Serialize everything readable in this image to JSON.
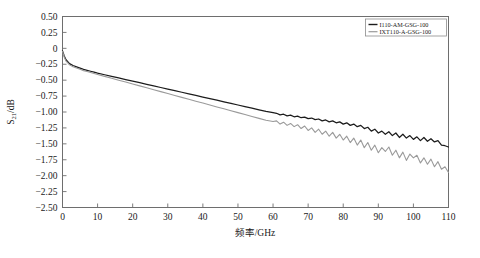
{
  "chart_data": {
    "type": "line",
    "title": "",
    "xlabel": "频率/GHz",
    "ylabel": "S21/dB",
    "ylabel_base": "S",
    "ylabel_sub": "21",
    "ylabel_unit": "/dB",
    "xlim": [
      0,
      110
    ],
    "ylim": [
      -2.5,
      0.5
    ],
    "xticks": [
      0,
      10,
      20,
      30,
      40,
      50,
      60,
      70,
      80,
      90,
      100,
      110
    ],
    "xtick_labels": [
      "0",
      "10",
      "20",
      "30",
      "40",
      "50",
      "60",
      "70",
      "80",
      "90",
      "100",
      "110"
    ],
    "yticks": [
      0.5,
      0.25,
      0,
      -0.25,
      -0.5,
      -0.75,
      -1.0,
      -1.25,
      -1.5,
      -1.75,
      -2.0,
      -2.25,
      -2.5
    ],
    "ytick_labels": [
      "0.50",
      "0.25",
      "0",
      "-0.25",
      "-0.50",
      "-0.75",
      "-1.00",
      "-1.25",
      "-1.50",
      "-1.75",
      "-2.00",
      "-2.25",
      "-2.50"
    ],
    "grid": false,
    "legend_position": "top-right",
    "series": [
      {
        "name": "I110-AM-GSG-100",
        "color": "#1c1c1c",
        "x": [
          0,
          0.5,
          1,
          1.5,
          2,
          3,
          4,
          5,
          6,
          7,
          8,
          9,
          10,
          12,
          14,
          16,
          18,
          20,
          22,
          24,
          26,
          28,
          30,
          32,
          34,
          36,
          38,
          40,
          42,
          44,
          46,
          48,
          50,
          52,
          54,
          56,
          58,
          60,
          61,
          62,
          63,
          64,
          65,
          66,
          67,
          68,
          69,
          70,
          71,
          72,
          73,
          74,
          75,
          76,
          77,
          78,
          79,
          80,
          81,
          82,
          83,
          84,
          85,
          86,
          87,
          88,
          89,
          90,
          91,
          92,
          93,
          94,
          95,
          96,
          97,
          98,
          99,
          100,
          101,
          102,
          103,
          104,
          105,
          106,
          107,
          108,
          109,
          110
        ],
        "y": [
          -0.04,
          -0.12,
          -0.18,
          -0.21,
          -0.24,
          -0.27,
          -0.29,
          -0.31,
          -0.33,
          -0.345,
          -0.36,
          -0.375,
          -0.39,
          -0.415,
          -0.44,
          -0.465,
          -0.49,
          -0.515,
          -0.54,
          -0.565,
          -0.59,
          -0.615,
          -0.64,
          -0.665,
          -0.69,
          -0.715,
          -0.74,
          -0.765,
          -0.79,
          -0.815,
          -0.84,
          -0.865,
          -0.89,
          -0.915,
          -0.94,
          -0.965,
          -0.99,
          -1.01,
          -1.02,
          -1.045,
          -1.035,
          -1.06,
          -1.05,
          -1.075,
          -1.065,
          -1.09,
          -1.08,
          -1.105,
          -1.095,
          -1.12,
          -1.11,
          -1.14,
          -1.125,
          -1.155,
          -1.14,
          -1.17,
          -1.155,
          -1.19,
          -1.17,
          -1.21,
          -1.19,
          -1.23,
          -1.21,
          -1.26,
          -1.24,
          -1.3,
          -1.27,
          -1.33,
          -1.3,
          -1.35,
          -1.31,
          -1.37,
          -1.33,
          -1.4,
          -1.35,
          -1.41,
          -1.37,
          -1.43,
          -1.39,
          -1.45,
          -1.4,
          -1.46,
          -1.42,
          -1.47,
          -1.45,
          -1.52,
          -1.53,
          -1.55
        ]
      },
      {
        "name": "IXT110-A-GSG-100",
        "color": "#9a9a9a",
        "x": [
          0,
          0.5,
          1,
          1.5,
          2,
          3,
          4,
          5,
          6,
          7,
          8,
          9,
          10,
          12,
          14,
          16,
          18,
          20,
          22,
          24,
          26,
          28,
          30,
          32,
          34,
          36,
          38,
          40,
          42,
          44,
          46,
          48,
          50,
          52,
          54,
          56,
          58,
          60,
          61,
          62,
          63,
          64,
          65,
          66,
          67,
          68,
          69,
          70,
          71,
          72,
          73,
          74,
          75,
          76,
          77,
          78,
          79,
          80,
          81,
          82,
          83,
          84,
          85,
          86,
          87,
          88,
          89,
          90,
          91,
          92,
          93,
          94,
          95,
          96,
          97,
          98,
          99,
          100,
          101,
          102,
          103,
          104,
          105,
          106,
          107,
          108,
          109,
          110
        ],
        "y": [
          -0.05,
          -0.14,
          -0.2,
          -0.23,
          -0.26,
          -0.29,
          -0.31,
          -0.33,
          -0.35,
          -0.365,
          -0.38,
          -0.395,
          -0.41,
          -0.44,
          -0.47,
          -0.5,
          -0.53,
          -0.56,
          -0.59,
          -0.62,
          -0.65,
          -0.68,
          -0.71,
          -0.74,
          -0.77,
          -0.8,
          -0.83,
          -0.86,
          -0.89,
          -0.92,
          -0.95,
          -0.98,
          -1.01,
          -1.04,
          -1.07,
          -1.1,
          -1.13,
          -1.15,
          -1.14,
          -1.19,
          -1.16,
          -1.21,
          -1.18,
          -1.23,
          -1.2,
          -1.26,
          -1.22,
          -1.29,
          -1.25,
          -1.32,
          -1.27,
          -1.35,
          -1.3,
          -1.38,
          -1.32,
          -1.41,
          -1.35,
          -1.44,
          -1.38,
          -1.48,
          -1.41,
          -1.52,
          -1.44,
          -1.56,
          -1.48,
          -1.6,
          -1.52,
          -1.64,
          -1.56,
          -1.62,
          -1.55,
          -1.68,
          -1.6,
          -1.72,
          -1.63,
          -1.76,
          -1.66,
          -1.72,
          -1.68,
          -1.8,
          -1.72,
          -1.82,
          -1.74,
          -1.86,
          -1.78,
          -1.9,
          -1.86,
          -1.95
        ]
      }
    ]
  },
  "legend": {
    "entries": [
      {
        "label": "I110-AM-GSG-100",
        "color": "#1c1c1c"
      },
      {
        "label": "IXT110-A-GSG-100",
        "color": "#9a9a9a"
      }
    ]
  }
}
